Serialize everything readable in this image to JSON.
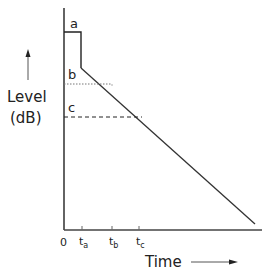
{
  "diagram": {
    "y_axis_label_line1": "Level",
    "y_axis_label_line2": "(dB)",
    "x_axis_label": "Time",
    "levels": [
      {
        "label": "a",
        "style": "solid"
      },
      {
        "label": "b",
        "style": "dotted"
      },
      {
        "label": "c",
        "style": "dashed"
      }
    ],
    "ticks": [
      {
        "label": "0",
        "base": "0",
        "sub": ""
      },
      {
        "label": "t_a",
        "base": "t",
        "sub": "a"
      },
      {
        "label": "t_b",
        "base": "t",
        "sub": "b"
      },
      {
        "label": "t_c",
        "base": "t",
        "sub": "c"
      }
    ],
    "line_color": "#222222"
  }
}
